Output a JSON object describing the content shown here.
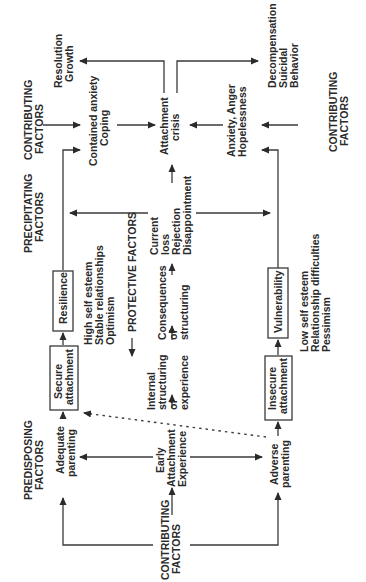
{
  "diagram": {
    "orientation": "rotated 90 degrees counterclockwise",
    "headers": {
      "predisposing": [
        "PREDISPOSING",
        "FACTORS"
      ],
      "precipitating": [
        "PRECIPITATING",
        "FACTORS"
      ],
      "contributing_bottom": [
        "CONTRIBUTING",
        "FACTORS"
      ],
      "contributing_top_left": [
        "CONTRIBUTING",
        "FACTORS"
      ],
      "contributing_top_right": [
        "CONTRIBUTING",
        "FACTORS"
      ],
      "protective": "PROTECTIVE FACTORS"
    },
    "nodes": {
      "early_attachment": [
        "Early",
        "Attachment",
        "Experience"
      ],
      "adequate_parenting": [
        "Adequate",
        "parenting"
      ],
      "adverse_parenting": [
        "Adverse",
        "parenting"
      ],
      "secure_attachment": [
        "Secure",
        "attachment"
      ],
      "insecure_attachment": [
        "Insecure",
        "attachment"
      ],
      "resilience": "Resilience",
      "vulnerability": "Vulnerability",
      "resilience_traits": [
        "High self esteem",
        "Stable relationships",
        "Optimism"
      ],
      "vulnerability_traits": [
        "Low self esteem",
        "Relationship difficulties",
        "Pessimism"
      ],
      "internal_structuring": [
        "Internal",
        "structuring",
        "of",
        "experience"
      ],
      "consequences": [
        "Consequences",
        "of",
        "structuring"
      ],
      "current_loss": [
        "Current",
        "loss",
        "Rejection",
        "Disappointment"
      ],
      "attachment_crisis": [
        "Attachment",
        "crisis"
      ],
      "contained_anxiety": [
        "Contained anxiety",
        "Coping"
      ],
      "anxiety_anger": [
        "Anxiety, Anger",
        "Hopelessness"
      ],
      "resolution": [
        "Resolution",
        "Growth"
      ],
      "decompensation": [
        "Decompensation",
        "Suicidal",
        "Behavior"
      ]
    }
  }
}
